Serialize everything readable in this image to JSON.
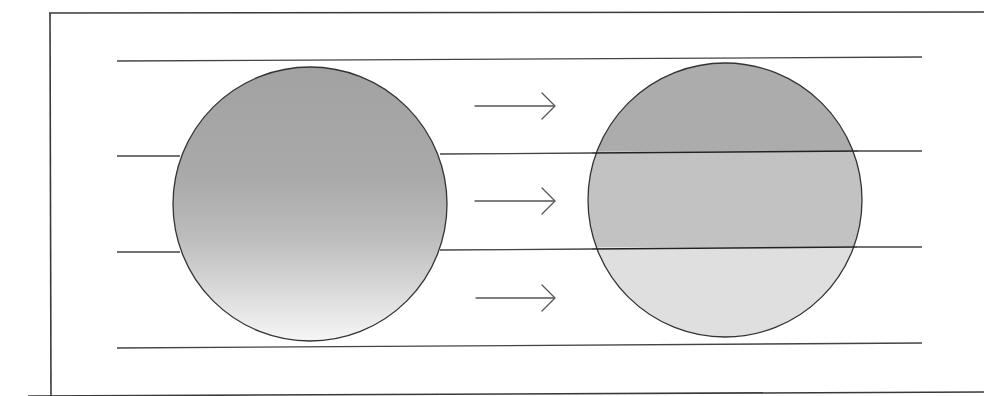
{
  "diagram": {
    "colors": {
      "background": "#ffffff",
      "frame": "#3a3a3a",
      "guide_lines": "#444444",
      "gradient_top": "#a3a3a3",
      "gradient_middle": "#b4b4b4",
      "gradient_bottom": "#f4f4f4",
      "band_top": "#acacac",
      "band_middle": "#c2c2c2",
      "band_bottom": "#dedede"
    },
    "guide_line_count": 4,
    "band_count": 3,
    "arrow_count": 3,
    "left_sphere_label": "continuous gradient sphere",
    "right_sphere_label": "banded sphere",
    "arrow_symbol": "→"
  }
}
